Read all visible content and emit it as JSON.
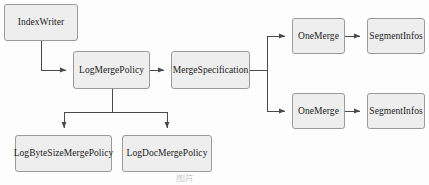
{
  "diagram": {
    "type": "flowchart",
    "background_color": "#fdfdfd",
    "node_fill_color": "#eeeeee",
    "node_border_color": "#9a9a9a",
    "edge_color": "#555555",
    "text_color": "#1c1c1c",
    "nodes": [
      {
        "id": "index-writer",
        "label": "IndexWriter",
        "x": 4,
        "y": 4,
        "w": 74,
        "h": 37
      },
      {
        "id": "log-merge-policy",
        "label": "LogMergePolicy",
        "x": 73,
        "y": 51,
        "w": 77,
        "h": 38
      },
      {
        "id": "merge-specification",
        "label": "MergeSpecification",
        "x": 171,
        "y": 51,
        "w": 79,
        "h": 38
      },
      {
        "id": "one-merge-top",
        "label": "OneMerge",
        "x": 292,
        "y": 18,
        "w": 53,
        "h": 36
      },
      {
        "id": "segment-infos-top",
        "label": "SegmentInfos",
        "x": 367,
        "y": 18,
        "w": 58,
        "h": 36
      },
      {
        "id": "one-merge-bottom",
        "label": "OneMerge",
        "x": 292,
        "y": 93,
        "w": 53,
        "h": 36
      },
      {
        "id": "segment-infos-bottom",
        "label": "SegmentInfos",
        "x": 367,
        "y": 93,
        "w": 58,
        "h": 36
      },
      {
        "id": "log-byte-size-merge-policy",
        "label": "LogByteSizeMergePolicy",
        "x": 15,
        "y": 135,
        "w": 97,
        "h": 37
      },
      {
        "id": "log-doc-merge-policy",
        "label": "LogDocMergePolicy",
        "x": 122,
        "y": 135,
        "w": 90,
        "h": 37
      }
    ],
    "edges": [
      {
        "id": "edge-indexwriter-to-logmergepolicy",
        "from": "index-writer",
        "to": "log-merge-policy",
        "style": "orthogonal",
        "arrow": true
      },
      {
        "id": "edge-logmergepolicy-to-mergespecification",
        "from": "log-merge-policy",
        "to": "merge-specification",
        "style": "straight",
        "arrow": true
      },
      {
        "id": "edge-mergespec-to-onemerge-top",
        "from": "merge-specification",
        "to": "one-merge-top",
        "style": "orthogonal",
        "arrow": true
      },
      {
        "id": "edge-mergespec-to-onemerge-bottom",
        "from": "merge-specification",
        "to": "one-merge-bottom",
        "style": "orthogonal",
        "arrow": true
      },
      {
        "id": "edge-onemerge-top-to-segmentinfos-top",
        "from": "one-merge-top",
        "to": "segment-infos-top",
        "style": "straight",
        "arrow": true
      },
      {
        "id": "edge-onemerge-bottom-to-segmentinfos-bottom",
        "from": "one-merge-bottom",
        "to": "segment-infos-bottom",
        "style": "straight",
        "arrow": true
      },
      {
        "id": "edge-logmergepolicy-to-logbytesize",
        "from": "log-merge-policy",
        "to": "log-byte-size-merge-policy",
        "style": "orthogonal",
        "arrow": true
      },
      {
        "id": "edge-logmergepolicy-to-logdoc",
        "from": "log-merge-policy",
        "to": "log-doc-merge-policy",
        "style": "orthogonal",
        "arrow": true
      }
    ]
  },
  "caption": {
    "text": "图片"
  }
}
